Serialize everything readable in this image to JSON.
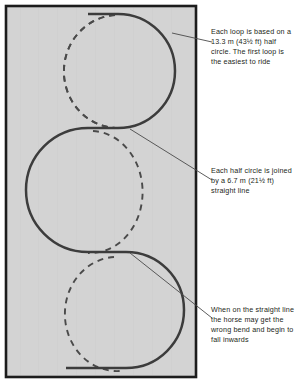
{
  "figure": {
    "arena": {
      "fill_color": "#d3d3d3",
      "border_color": "#1c1c1c",
      "label": "arena-rectangle"
    },
    "track": {
      "solid_color": "#3c3c3c",
      "dashed_color": "#4a4a4a",
      "solid_label": "correct-serpentine-track",
      "dashed_label": "incorrect-bend-track"
    },
    "leader_line_color": "#4a4a4a"
  },
  "annotations": [
    {
      "id": "loop-basis-note",
      "text": "Each loop is based on a 13.3 m (43½ ft) half circle. The first loop is the easiest to ride"
    },
    {
      "id": "straight-line-note",
      "text": "Each half circle is joined by a 6.7 m (21½ ft) straight line"
    },
    {
      "id": "wrong-bend-note",
      "text": "When on the straight line the horse may get the wrong bend and begin to fall inwards"
    }
  ],
  "caption": {
    "text": ""
  }
}
